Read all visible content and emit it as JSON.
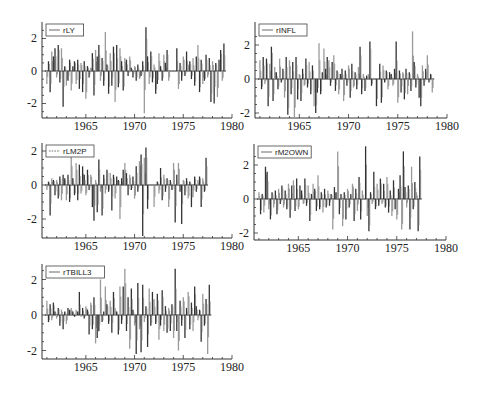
{
  "figure": {
    "background": "#ffffff",
    "axis_color": "#333333",
    "bar_dark": "#333333",
    "bar_light": "#9a9a9a"
  },
  "chart_data": [
    {
      "type": "bar",
      "title": "",
      "legend": "rLY",
      "legend_style": "solid",
      "xlabel": "",
      "ylabel": "",
      "x_ticks": [
        "1965",
        "1970",
        "1975",
        "1980"
      ],
      "y_ticks": [
        "2",
        "0",
        "-2"
      ],
      "xlim": [
        1960.5,
        1980
      ],
      "ylim": [
        -3,
        3
      ],
      "grid": false,
      "legend_position": "top-left",
      "x_start": 1961.0,
      "x_step": 0.1667,
      "values": [
        -0.8,
        0.6,
        -1.3,
        1.2,
        0.9,
        1.4,
        -0.4,
        1.6,
        -0.7,
        1.4,
        -2.2,
        0.3,
        -0.9,
        -0.6,
        0.7,
        -1.2,
        0.3,
        0.6,
        -0.8,
        0.7,
        -1.1,
        0.5,
        -1.3,
        0.6,
        -1.7,
        0.3,
        -0.4,
        0.2,
        1.1,
        -1.5,
        1.3,
        0.9,
        1.6,
        -0.6,
        0.8,
        -0.9,
        2.4,
        0.4,
        -1.4,
        1.1,
        -0.9,
        1.5,
        -1.9,
        1.6,
        -1.0,
        1.4,
        0.6,
        -1.2,
        0.8,
        0.7,
        -0.3,
        0.9,
        0.2,
        -0.4,
        0.3,
        -0.6,
        0.4,
        -0.5,
        -0.3,
        0.6,
        -2.6,
        2.7,
        0.9,
        -0.8,
        1.2,
        -0.7,
        0.4,
        -1.4,
        -0.8,
        1.1,
        0.3,
        -0.6,
        1.0,
        0.5,
        1.3,
        -0.6,
        0.0,
        0.0,
        0.0,
        0.0,
        1.4,
        -1.1,
        0.5,
        -0.6,
        0.9,
        -0.3,
        1.2,
        0.4,
        0.6,
        -0.5,
        0.8,
        -0.9,
        0.9,
        1.6,
        -1.3,
        0.7,
        -0.8,
        -0.6,
        1.0,
        -0.4,
        0.8,
        -1.9,
        0.6,
        -2.0,
        0.5,
        -1.6,
        0.7,
        1.3,
        -0.6,
        1.7
      ]
    },
    {
      "type": "bar",
      "title": "",
      "legend": "rINFL",
      "legend_style": "solid",
      "xlabel": "",
      "ylabel": "",
      "x_ticks": [
        "1965",
        "1970",
        "1975",
        "1980"
      ],
      "y_ticks": [
        "2",
        "0",
        "-2"
      ],
      "xlim": [
        1960.5,
        1980
      ],
      "ylim": [
        -2.3,
        3
      ],
      "grid": false,
      "legend_position": "top-left",
      "x_start": 1961.0,
      "x_step": 0.1667,
      "values": [
        1.1,
        -0.6,
        1.3,
        -0.3,
        1.2,
        -1.6,
        0.9,
        1.9,
        -1.3,
        0.7,
        0.4,
        -0.6,
        1.2,
        -0.2,
        0.6,
        -1.1,
        1.3,
        -2.1,
        1.1,
        -0.9,
        1.0,
        -2.3,
        1.3,
        -1.2,
        0.3,
        -1.3,
        0.6,
        -0.4,
        1.2,
        -0.5,
        1.0,
        -0.9,
        0.8,
        -1.6,
        -2.0,
        -0.8,
        2.1,
        -0.9,
        0.4,
        1.8,
        0.6,
        1.3,
        1.1,
        -0.4,
        1.0,
        1.4,
        -0.7,
        0.5,
        -0.9,
        0.3,
        0.6,
        -1.3,
        0.5,
        -0.4,
        0.8,
        -1.1,
        0.9,
        -0.5,
        0.4,
        -0.6,
        0.7,
        1.9,
        -0.9,
        0.3,
        -0.7,
        0.2,
        0.3,
        2.2,
        -0.4,
        0.0,
        0.0,
        -1.6,
        0.0,
        0.9,
        -1.4,
        0.8,
        -0.2,
        0.5,
        -0.6,
        0.4,
        0.3,
        -0.4,
        0.6,
        2.2,
        -1.4,
        0.5,
        -0.8,
        0.4,
        -1.2,
        0.6,
        -0.9,
        0.4,
        -0.7,
        2.8,
        1.0,
        -0.5,
        0.3,
        -1.1,
        -1.6,
        0.8,
        -0.4,
        0.6,
        1.4,
        -0.2,
        0.3,
        -0.8
      ]
    },
    {
      "type": "bar",
      "title": "",
      "legend": "rLM2P",
      "legend_style": "dashed",
      "xlabel": "",
      "ylabel": "",
      "x_ticks": [
        "1965",
        "1970",
        "1975",
        "1980"
      ],
      "y_ticks": [
        "2",
        "0",
        "-2"
      ],
      "xlim": [
        1960.5,
        1980
      ],
      "ylim": [
        -3,
        2.4
      ],
      "grid": false,
      "legend_position": "top-left",
      "x_start": 1961.0,
      "x_step": 0.1667,
      "values": [
        -0.3,
        0.2,
        -1.8,
        0.4,
        0.3,
        -0.6,
        0.3,
        -0.8,
        0.5,
        -0.9,
        0.6,
        0.4,
        -0.9,
        0.6,
        -1.0,
        1.7,
        0.4,
        -0.6,
        1.3,
        -0.9,
        1.2,
        -0.5,
        1.1,
        0.6,
        -0.6,
        0.9,
        -0.3,
        0.6,
        -1.3,
        -2.1,
        0.3,
        -1.6,
        1.5,
        -0.4,
        -1.8,
        0.6,
        -0.5,
        0.9,
        -0.4,
        0.7,
        -1.5,
        0.6,
        -0.8,
        0.5,
        0.3,
        -2.0,
        0.4,
        0.9,
        1.3,
        0.7,
        -0.6,
        0.6,
        -0.3,
        0.5,
        -0.8,
        1.1,
        -0.4,
        1.4,
        1.8,
        -3.0,
        1.6,
        2.2,
        -1.4,
        0.0,
        0.0,
        0.0,
        -1.3,
        0.0,
        0.2,
        -0.5,
        1.0,
        -0.9,
        0.6,
        -0.4,
        0.4,
        -1.3,
        0.3,
        -0.3,
        1.3,
        -2.2,
        0.6,
        1.3,
        -0.4,
        -2.3,
        0.3,
        -0.6,
        0.4,
        -0.8,
        0.2,
        -1.3,
        -0.7,
        0.5,
        -0.4,
        0.3,
        0.5,
        -1.3,
        0.4,
        -0.4,
        1.6
      ]
    },
    {
      "type": "bar",
      "title": "",
      "legend": "rM2OWN",
      "legend_style": "solid",
      "xlabel": "",
      "ylabel": "",
      "x_ticks": [
        "1965",
        "1970",
        "1975",
        "1980"
      ],
      "y_ticks": [
        "2",
        "0",
        "-2"
      ],
      "xlim": [
        1960.5,
        1980
      ],
      "ylim": [
        -2.4,
        3.2
      ],
      "grid": false,
      "legend_position": "top-left",
      "x_start": 1961.0,
      "x_step": 0.1667,
      "values": [
        0.4,
        -0.9,
        0.3,
        -0.8,
        1.9,
        1.6,
        -0.6,
        -1.2,
        0.4,
        -0.5,
        0.5,
        -0.9,
        0.6,
        -0.3,
        0.8,
        -0.5,
        0.5,
        -0.6,
        0.9,
        -1.1,
        0.8,
        1.1,
        -0.7,
        1.2,
        -0.6,
        0.8,
        0.5,
        -0.3,
        1.2,
        -0.4,
        0.8,
        -1.3,
        0.3,
        0.9,
        0.6,
        -0.7,
        1.4,
        -0.6,
        0.4,
        -0.8,
        0.6,
        -0.5,
        0.5,
        -0.4,
        0.3,
        -1.8,
        0.7,
        0.4,
        2.8,
        -0.9,
        0.3,
        -1.6,
        0.4,
        -1.2,
        0.6,
        -0.5,
        0.3,
        0.9,
        -1.3,
        0.6,
        -0.7,
        1.3,
        -1.2,
        0.5,
        0.0,
        3.1,
        -1.0,
        -1.9,
        0.4,
        -0.3,
        1.6,
        -0.6,
        0.9,
        -0.4,
        1.2,
        -0.3,
        0.9,
        -0.5,
        1.3,
        -0.8,
        0.5,
        -1.0,
        1.1,
        -0.6,
        -1.2,
        0.6,
        1.4,
        -1.8,
        2.8,
        0.7,
        -0.5,
        0.8,
        -1.8,
        1.9,
        -0.6,
        1.0,
        0.4,
        -1.9,
        2.5
      ]
    },
    {
      "type": "bar",
      "title": "",
      "legend": "rTBILL3",
      "legend_style": "solid",
      "xlabel": "",
      "ylabel": "",
      "x_ticks": [
        "1965",
        "1970",
        "1975",
        "1980"
      ],
      "y_ticks": [
        "2",
        "0",
        "-2"
      ],
      "xlim": [
        1960.5,
        1980
      ],
      "ylim": [
        -2.3,
        2.8
      ],
      "grid": false,
      "legend_position": "top-left",
      "x_start": 1961.0,
      "x_step": 0.1667,
      "values": [
        0.8,
        -0.4,
        0.6,
        -0.3,
        0.7,
        0.2,
        -0.2,
        0.4,
        -0.6,
        0.3,
        -0.8,
        0.2,
        -0.5,
        0.4,
        0.3,
        0.4,
        0.2,
        -0.1,
        0.3,
        0.2,
        1.3,
        -0.1,
        0.4,
        -0.2,
        0.5,
        0.3,
        -1.1,
        0.7,
        -0.8,
        1.0,
        -1.6,
        -1.3,
        -0.9,
        2.0,
        -0.4,
        0.2,
        1.6,
        0.6,
        -0.5,
        0.8,
        -1.0,
        1.3,
        0.4,
        0.2,
        -1.1,
        1.6,
        -0.5,
        1.6,
        2.6,
        -0.9,
        1.0,
        -1.9,
        1.5,
        0.3,
        -0.6,
        -2.2,
        1.8,
        -0.8,
        -2.1,
        1.7,
        -0.4,
        0.5,
        -1.8,
        1.5,
        -0.6,
        1.3,
        0.9,
        -0.5,
        1.2,
        -1.4,
        -0.6,
        1.4,
        -0.9,
        0.5,
        -1.0,
        0.4,
        -0.9,
        0.6,
        -1.3,
        2.6,
        -0.9,
        -2.0,
        0.8,
        -0.6,
        1.0,
        -1.3,
        0.4,
        1.3,
        -0.8,
        0.7,
        -0.9,
        1.6,
        0.5,
        -0.3,
        0.3,
        -1.5,
        1.2,
        -0.6,
        0.9,
        -2.2,
        1.7
      ]
    }
  ]
}
